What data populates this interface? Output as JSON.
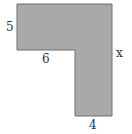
{
  "diagram": {
    "type": "L-shaped polygon",
    "shape": {
      "fill": "#a9a9a9",
      "stroke": "#6f6f6f",
      "points": "17,4 112,4 112,116 75,116 75,50 17,50"
    },
    "labels": {
      "left_side": "5",
      "inner_bottom": "6",
      "right_side": "x",
      "bottom": "4"
    }
  }
}
